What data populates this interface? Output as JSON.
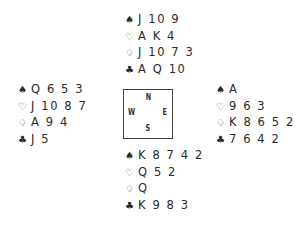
{
  "diagram": {
    "type": "bridge-deal",
    "compass": {
      "north_label": "N",
      "south_label": "S",
      "east_label": "E",
      "west_label": "W"
    },
    "suit_symbols": {
      "spades": "♠",
      "hearts": "♡",
      "diamonds": "♢",
      "clubs": "♣"
    },
    "hands": {
      "north": {
        "spades": "J 10 9",
        "hearts": "A K 4",
        "diamonds": "J 10 7 3",
        "clubs": "A Q 10"
      },
      "west": {
        "spades": "Q 6 5 3",
        "hearts": "J 10 8 7",
        "diamonds": "A 9 4",
        "clubs": "J 5"
      },
      "east": {
        "spades": "A",
        "hearts": "9 6 3",
        "diamonds": "K 8 6 5 2",
        "clubs": "7 6 4 2"
      },
      "south": {
        "spades": "K 8 7 4 2",
        "hearts": "Q 5 2",
        "diamonds": "Q",
        "clubs": "K 9 8 3"
      }
    }
  }
}
